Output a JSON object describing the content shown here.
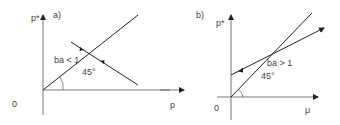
{
  "panels": [
    {
      "id": "a",
      "label": "a)",
      "y_axis_label": "p*",
      "x_axis_label": "p",
      "origin_label": "0",
      "condition_label": "ba < 1",
      "angle_label": "45°"
    },
    {
      "id": "b",
      "label": "b)",
      "y_axis_label": "p*",
      "x_axis_label": "μ",
      "origin_label": "0",
      "condition_label": "ba > 1",
      "angle_label": "45°"
    }
  ],
  "colors": {
    "line": "#222222",
    "axis": "#555555",
    "text": "#444444"
  }
}
